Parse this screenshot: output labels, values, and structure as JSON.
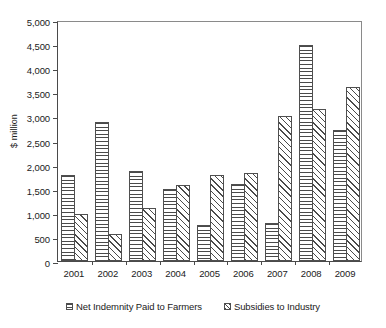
{
  "chart_data": {
    "type": "bar",
    "title": "",
    "subtitle": "",
    "xlabel": "",
    "ylabel": "$ million",
    "categories": [
      "2001",
      "2002",
      "2003",
      "2004",
      "2005",
      "2006",
      "2007",
      "2008",
      "2009"
    ],
    "series": [
      {
        "name": "Net Indemnity Paid to Farmers",
        "pattern": "horizontal-lines",
        "values": [
          1780,
          2880,
          1870,
          1500,
          740,
          1600,
          790,
          4490,
          2720
        ]
      },
      {
        "name": "Subsidies to Industry",
        "pattern": "diagonal-hatch",
        "values": [
          980,
          570,
          1110,
          1580,
          1790,
          1820,
          3000,
          3150,
          3600
        ]
      }
    ],
    "ylim": [
      0,
      5000
    ],
    "ytick_values": [
      0,
      500,
      1000,
      1500,
      2000,
      2500,
      3000,
      3500,
      4000,
      4500,
      5000
    ],
    "ytick_labels": [
      "0",
      "500",
      "1,000",
      "1,500",
      "2,000",
      "2,500",
      "3,000",
      "3,500",
      "4,000",
      "4,500",
      "5,000"
    ],
    "grid": false,
    "legend_position": "bottom",
    "colors": {
      "axis": "#4a4a4a",
      "bar_outline": "#4f4f4f",
      "pattern": "#4a4a4a",
      "background": "#ffffff"
    }
  },
  "legend": {
    "items": [
      {
        "label": "Net Indemnity Paid to Farmers",
        "swatch": "indemnity-swatch-icon"
      },
      {
        "label": "Subsidies to Industry",
        "swatch": "subsidies-swatch-icon"
      }
    ]
  }
}
